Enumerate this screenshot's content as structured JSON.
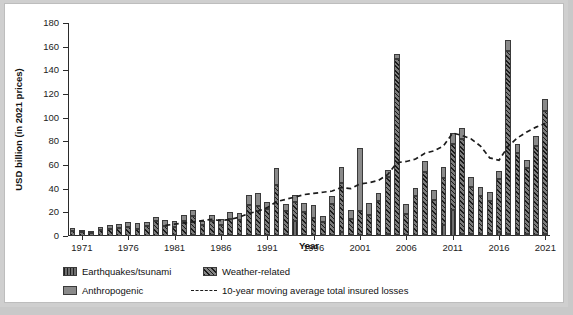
{
  "axes": {
    "ylabel": "USD billion (in 2021 prices)",
    "xlabel": "Year",
    "yticks": [
      "0",
      "20",
      "40",
      "60",
      "80",
      "100",
      "120",
      "140",
      "160",
      "180"
    ],
    "xticks": [
      "1971",
      "1976",
      "1981",
      "1986",
      "1991",
      "1996",
      "2001",
      "2006",
      "2011",
      "2016",
      "2021"
    ]
  },
  "legend": {
    "items": [
      {
        "label": "Earthquakes/tsunami",
        "swatch": "earthquake-swatch",
        "color": "#6e6e6e"
      },
      {
        "label": "Weather-related",
        "swatch": "weather-swatch",
        "color": "#5a5a5a"
      },
      {
        "label": "Anthropogenic",
        "swatch": "anthropogenic-swatch",
        "color": "#8a8a8a"
      },
      {
        "label": "10-year moving average total insured losses",
        "swatch": "dashed-line-swatch",
        "color": "#1c1c1c"
      }
    ]
  },
  "chart_data": {
    "type": "bar",
    "title": "",
    "xlabel": "Year",
    "ylabel": "USD billion (in 2021 prices)",
    "ylim": [
      0,
      180
    ],
    "ytick_step": 20,
    "grid": false,
    "legend_position": "bottom",
    "stacked": true,
    "categories": [
      "1970",
      "1971",
      "1972",
      "1973",
      "1974",
      "1975",
      "1976",
      "1977",
      "1978",
      "1979",
      "1980",
      "1981",
      "1982",
      "1983",
      "1984",
      "1985",
      "1986",
      "1987",
      "1988",
      "1989",
      "1990",
      "1991",
      "1992",
      "1993",
      "1994",
      "1995",
      "1996",
      "1997",
      "1998",
      "1999",
      "2000",
      "2001",
      "2002",
      "2003",
      "2004",
      "2005",
      "2006",
      "2007",
      "2008",
      "2009",
      "2010",
      "2011",
      "2012",
      "2013",
      "2014",
      "2015",
      "2016",
      "2017",
      "2018",
      "2019",
      "2020",
      "2021"
    ],
    "series": [
      {
        "name": "Earthquakes/tsunami",
        "values": [
          0.3,
          0.2,
          0.2,
          0.3,
          0.3,
          0.3,
          0.4,
          0.3,
          0.4,
          0.4,
          0.4,
          0.5,
          0.4,
          0.6,
          0.5,
          0.6,
          0.6,
          0.7,
          0.8,
          1.0,
          1.0,
          1.0,
          1.2,
          1.0,
          13.0,
          1.2,
          1.0,
          1.2,
          1.0,
          3.0,
          1.0,
          1.0,
          1.0,
          1.2,
          1.5,
          1.2,
          1.0,
          1.0,
          1.2,
          1.2,
          9.0,
          22.0,
          2.0,
          1.5,
          1.5,
          1.5,
          3.0,
          1.5,
          2.0,
          1.5,
          1.2,
          2.0
        ]
      },
      {
        "name": "Weather-related",
        "values": [
          4.0,
          3.5,
          2.0,
          4.5,
          6.0,
          6.5,
          7.5,
          5.5,
          8.0,
          12.0,
          8.0,
          7.5,
          12.0,
          16.0,
          9.0,
          12.0,
          9.0,
          14.0,
          13.0,
          25.0,
          24.0,
          22.0,
          42.0,
          20.0,
          16.0,
          19.0,
          14.0,
          11.0,
          26.0,
          42.0,
          13.0,
          20.0,
          17.0,
          28.0,
          48.0,
          148.0,
          18.0,
          33.0,
          53.0,
          29.0,
          40.0,
          56.0,
          80.0,
          40.0,
          32.0,
          28.0,
          45.0,
          155.0,
          68.0,
          56.0,
          75.0,
          104.0
        ]
      },
      {
        "name": "Anthropogenic",
        "values": [
          2.5,
          1.5,
          1.5,
          2.5,
          3.0,
          3.0,
          4.0,
          5.0,
          3.5,
          3.5,
          5.0,
          4.5,
          5.0,
          5.0,
          3.5,
          5.0,
          4.5,
          5.5,
          5.5,
          9.0,
          11.0,
          6.0,
          14.0,
          6.0,
          6.0,
          8.0,
          11.0,
          5.0,
          7.0,
          13.0,
          8.0,
          53.0,
          10.0,
          7.0,
          6.0,
          5.0,
          8.0,
          7.0,
          9.0,
          9.0,
          9.0,
          9.0,
          9.0,
          8.0,
          8.0,
          8.0,
          7.0,
          9.0,
          8.0,
          7.0,
          8.0,
          10.0
        ]
      }
    ],
    "moving_average": {
      "name": "10-year moving average total insured losses",
      "style": "dashed",
      "color": "#1c1c1c",
      "x": [
        "1980",
        "1981",
        "1982",
        "1983",
        "1984",
        "1985",
        "1986",
        "1987",
        "1988",
        "1989",
        "1990",
        "1991",
        "1992",
        "1993",
        "1994",
        "1995",
        "1996",
        "1997",
        "1998",
        "1999",
        "2000",
        "2001",
        "2002",
        "2003",
        "2004",
        "2005",
        "2006",
        "2007",
        "2008",
        "2009",
        "2010",
        "2011",
        "2012",
        "2013",
        "2014",
        "2015",
        "2016",
        "2017",
        "2018",
        "2019",
        "2020",
        "2021"
      ],
      "values": [
        9.0,
        10.0,
        11.0,
        12.0,
        13.0,
        14.0,
        13.0,
        14.0,
        16.0,
        19.0,
        21.0,
        24.0,
        29.0,
        31.0,
        33.0,
        35.0,
        36.0,
        37.0,
        38.0,
        41.0,
        40.0,
        44.0,
        45.0,
        47.0,
        52.0,
        62.0,
        63.0,
        65.0,
        70.0,
        72.0,
        76.0,
        87.0,
        85.0,
        82.0,
        76.0,
        66.0,
        64.0,
        76.0,
        83.0,
        88.0,
        92.0,
        95.0
      ]
    }
  }
}
